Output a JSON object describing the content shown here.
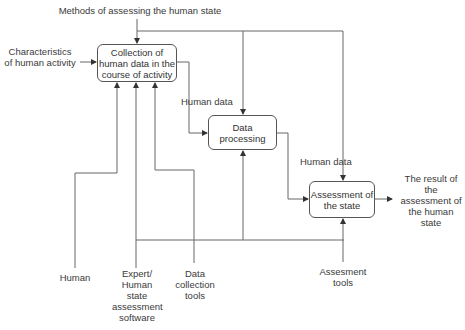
{
  "diagram": {
    "type": "IDEF0 process diagram",
    "colors": {
      "line": "#555555",
      "text": "#333333",
      "background": "#ffffff"
    },
    "controls": {
      "top": "Methods of assessing the human state"
    },
    "inputs": {
      "left": "Characteristics of human activity"
    },
    "processes": [
      {
        "id": "collection",
        "label": "Collection of human data in the course of activity"
      },
      {
        "id": "processing",
        "label": "Data processing"
      },
      {
        "id": "assessment",
        "label": "Assessment of the state"
      }
    ],
    "flows": [
      {
        "from": "collection",
        "to": "processing",
        "label": "Human data"
      },
      {
        "from": "processing",
        "to": "assessment",
        "label": "Human data"
      }
    ],
    "outputs": {
      "right": "The result of the assessment of the human state"
    },
    "mechanisms": [
      {
        "id": "human",
        "label": "Human"
      },
      {
        "id": "expert",
        "label": "Expert/ Human state assessment software"
      },
      {
        "id": "tools",
        "label": "Data collection tools"
      },
      {
        "id": "assess_tools",
        "label": "Assesment tools"
      }
    ]
  }
}
